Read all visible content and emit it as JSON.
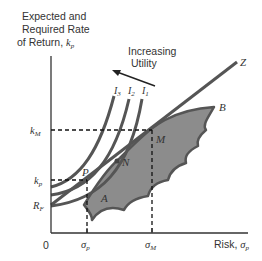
{
  "diagram": {
    "y_axis_label": [
      "Expected and",
      "Required Rate",
      "of Return, "
    ],
    "y_axis_symbol": "k",
    "y_axis_subscript": "p",
    "x_axis_label": "Risk, ",
    "x_axis_symbol": "σ",
    "x_axis_subscript": "p",
    "origin": "0",
    "annotation": [
      "Increasing",
      "Utility"
    ],
    "indifference_curves": [
      {
        "label": "I",
        "sub": "3"
      },
      {
        "label": "I",
        "sub": "2"
      },
      {
        "label": "I",
        "sub": "1"
      }
    ],
    "points": {
      "M": "M",
      "N": "N",
      "P": "P",
      "A": "A",
      "B": "B",
      "Z": "Z"
    },
    "y_ticks": [
      {
        "sym": "k",
        "sub": "M"
      },
      {
        "sym": "k",
        "sub": "p"
      },
      {
        "sym": "R",
        "sub": "F"
      }
    ],
    "x_ticks": [
      {
        "sym": "σ",
        "sub": "p"
      },
      {
        "sym": "σ",
        "sub": "M"
      }
    ],
    "colors": {
      "line": "#555555",
      "fill": "#8c8c8c",
      "axis": "#333333"
    }
  }
}
